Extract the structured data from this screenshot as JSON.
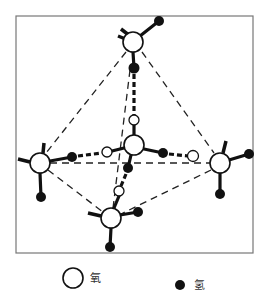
{
  "diagram": {
    "title": "",
    "frame": {
      "x": 16,
      "y": 16,
      "width": 237,
      "height": 237
    },
    "molecules": [
      {
        "id": "top",
        "oxygen": [
          133,
          42
        ],
        "hydrogens": [
          [
            159,
            21
          ],
          [
            134,
            68
          ]
        ]
      },
      {
        "id": "left",
        "oxygen": [
          40,
          163
        ],
        "hydrogens": [
          [
            72,
            157
          ],
          [
            41,
            197
          ]
        ]
      },
      {
        "id": "center",
        "oxygen": [
          134,
          145
        ],
        "hydrogens": [
          [
            163,
            153
          ],
          [
            128,
            168
          ]
        ]
      },
      {
        "id": "right",
        "oxygen": [
          220,
          163
        ],
        "hydrogens": [
          [
            249,
            154
          ],
          [
            220,
            194
          ]
        ]
      },
      {
        "id": "bottom",
        "oxygen": [
          111,
          218
        ],
        "hydrogens": [
          [
            138,
            212
          ],
          [
            110,
            247
          ]
        ]
      }
    ],
    "bridge_oxygens": [
      [
        134,
        120
      ],
      [
        107,
        152
      ],
      [
        193,
        156
      ],
      [
        119,
        191
      ]
    ],
    "colors": {
      "oxygen_fill": "#ffffff",
      "hydrogen_fill": "#111111",
      "line": "#111111"
    }
  },
  "legend": {
    "items": [
      {
        "symbol": "open-circle",
        "label": "氧"
      },
      {
        "symbol": "filled-circle",
        "label": "氢"
      }
    ]
  }
}
